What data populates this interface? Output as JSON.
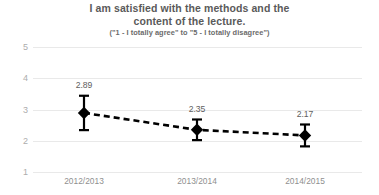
{
  "chart_data": {
    "type": "line",
    "title": "I am satisfied with the methods and the content of the lecture.",
    "title_line1": "I am satisfied with the methods and the",
    "title_line2": "content of the lecture.",
    "subtitle": "(\"1 - I totally agree\" to \"5 - I totally disagree\")",
    "xlabel": "",
    "ylabel": "",
    "categories": [
      "2012/2013",
      "2013/2014",
      "2014/2015"
    ],
    "values": [
      2.89,
      2.35,
      2.17
    ],
    "value_labels": [
      "2.89",
      "2.35",
      "2.17"
    ],
    "error_bars": [
      0.55,
      0.33,
      0.35
    ],
    "ylim": [
      1,
      5
    ],
    "yticks": [
      "5",
      "4",
      "3",
      "2",
      "1"
    ],
    "ytick_values": [
      5,
      4,
      3,
      2,
      1
    ],
    "grid": true,
    "legend": "none",
    "line_style": "dashed",
    "marker": "diamond",
    "colors": {
      "series": "#000000",
      "grid": "#e9e9e9",
      "title_text": "#5a5a5a",
      "subtitle_text": "#6b6b6b",
      "tick_text": "#a0a0a0",
      "label_text": "#606060",
      "background": "#ffffff"
    }
  }
}
